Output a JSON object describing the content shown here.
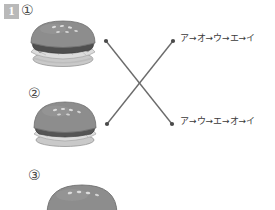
{
  "page": {
    "width": 275,
    "height": 210,
    "background": "#ffffff"
  },
  "question": {
    "number": "1",
    "badge_bg": "#b9b9b9",
    "badge_fg": "#ffffff"
  },
  "items": [
    {
      "marker": "①",
      "image_name": "hamburger-photo-1",
      "alt": "hamburger with sesame seed bun, patty and lettuce"
    },
    {
      "marker": "②",
      "image_name": "hamburger-photo-2",
      "alt": "hamburger with sesame seed bun and lettuce"
    },
    {
      "marker": "③",
      "image_name": "hamburger-photo-3",
      "alt": "hamburger top bun with sesame seeds, partially visible"
    }
  ],
  "options": [
    {
      "id": "option-a",
      "text": "ア→オ→ウ→エ→イ"
    },
    {
      "id": "option-b",
      "text": "ア→ウ→エ→オ→イ"
    }
  ],
  "connectors": {
    "line_color": "#6b6b6b",
    "dot_color": "#4a4a4a",
    "lines": [
      {
        "name": "line-item1-to-option-b",
        "x1": 106,
        "y1": 41,
        "x2": 172,
        "y2": 124
      },
      {
        "name": "line-item2-to-option-a",
        "x1": 107,
        "y1": 124,
        "x2": 173,
        "y2": 41
      }
    ],
    "endpoints": [
      {
        "name": "connector-dot-top-left",
        "cx": 106,
        "cy": 41
      },
      {
        "name": "connector-dot-top-right",
        "cx": 173,
        "cy": 41
      },
      {
        "name": "connector-dot-bottom-left",
        "cx": 107,
        "cy": 124
      },
      {
        "name": "connector-dot-bottom-right",
        "cx": 172,
        "cy": 124
      }
    ]
  },
  "burger_colors": {
    "bun_top": "#8e8e8e",
    "bun_top_light": "#a3a3a3",
    "bun_top_dark": "#767676",
    "seed": "#d8d8d8",
    "patty": "#4f4f4f",
    "cheese": "#9c9c9c",
    "lettuce": "#d6d6d6",
    "lettuce_line": "#a8a8a8",
    "bun_bottom": "#c2c2c2",
    "outline": "#707070"
  }
}
